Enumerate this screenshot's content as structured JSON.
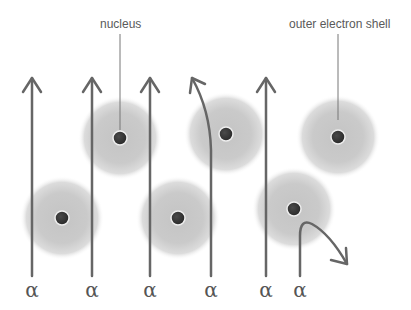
{
  "diagram": {
    "labels": {
      "nucleus": "nucleus",
      "outer_shell": "outer electron shell"
    },
    "particle_symbol": "α",
    "colors": {
      "arrow": "#666666",
      "shell": "#c8c8c8",
      "nucleus": "#3a3a3a",
      "nucleus_rim": "#eeeeee",
      "text": "#5a5a5a"
    },
    "alpha_particles": [
      {
        "x": 32,
        "path": "straight"
      },
      {
        "x": 92,
        "path": "straight"
      },
      {
        "x": 150,
        "path": "straight"
      },
      {
        "x": 210,
        "path": "slightly-deflected"
      },
      {
        "x": 267,
        "path": "straight"
      },
      {
        "x": 300,
        "path": "strongly-deflected"
      }
    ],
    "atoms": [
      {
        "cx": 62,
        "cy": 218
      },
      {
        "cx": 120,
        "cy": 138
      },
      {
        "cx": 178,
        "cy": 218
      },
      {
        "cx": 226,
        "cy": 134
      },
      {
        "cx": 294,
        "cy": 209
      },
      {
        "cx": 338,
        "cy": 137
      }
    ]
  }
}
